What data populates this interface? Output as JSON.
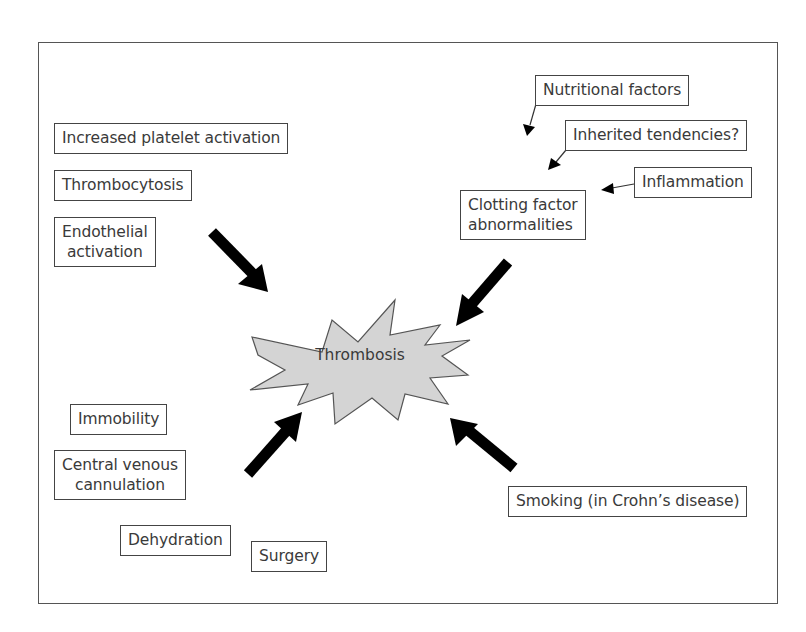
{
  "diagram": {
    "center": {
      "label": "Thrombosis",
      "shape": "starburst",
      "fill": "#d4d4d4"
    },
    "factors": [
      {
        "id": "increased-platelet-activation",
        "label": "Increased platelet activation"
      },
      {
        "id": "thrombocytosis",
        "label": "Thrombocytosis"
      },
      {
        "id": "endothelial-activation",
        "lines": [
          "Endothelial",
          "activation"
        ]
      },
      {
        "id": "nutritional-factors",
        "label": "Nutritional factors"
      },
      {
        "id": "inherited-tendencies",
        "label": "Inherited tendencies?"
      },
      {
        "id": "inflammation",
        "label": "Inflammation"
      },
      {
        "id": "clotting-factor-abnormalities",
        "lines": [
          "Clotting factor",
          "abnormalities"
        ]
      },
      {
        "id": "immobility",
        "label": "Immobility"
      },
      {
        "id": "central-venous-cannulation",
        "lines": [
          "Central venous",
          "cannulation"
        ]
      },
      {
        "id": "dehydration",
        "label": "Dehydration"
      },
      {
        "id": "surgery",
        "label": "Surgery"
      },
      {
        "id": "smoking",
        "label": "Smoking (in Crohn’s disease)"
      }
    ],
    "arrows": [
      {
        "from": "endothelial-activation group",
        "to": "Thrombosis",
        "style": "thick"
      },
      {
        "from": "clotting-factor-abnormalities",
        "to": "Thrombosis",
        "style": "thick"
      },
      {
        "from": "lower-left group",
        "to": "Thrombosis",
        "style": "thick"
      },
      {
        "from": "smoking",
        "to": "Thrombosis",
        "style": "thick"
      },
      {
        "from": "nutritional-factors",
        "to": "clotting-factor-abnormalities",
        "style": "thin"
      },
      {
        "from": "inherited-tendencies",
        "to": "clotting-factor-abnormalities",
        "style": "thin"
      },
      {
        "from": "inflammation",
        "to": "clotting-factor-abnormalities",
        "style": "thin"
      }
    ],
    "colors": {
      "arrow": "#000000",
      "border": "#444444",
      "starburst_fill": "#d4d4d4",
      "text": "#3a3a3a"
    }
  }
}
